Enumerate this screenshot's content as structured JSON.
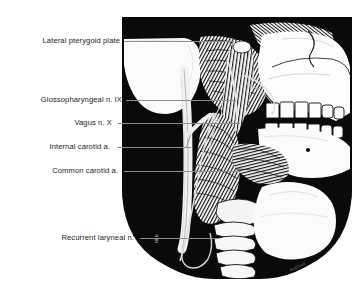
{
  "figure": {
    "type": "anatomical-illustration",
    "style": "pen-and-ink line drawing on black field",
    "background_color": "#ffffff",
    "plate_color": "#0a0a0a",
    "label_color": "#1c1c1c",
    "leader_color": "#9a9a9a"
  },
  "labels": [
    {
      "id": "lateral-pterygoid-plate",
      "text": "Lateral pterygoid plate",
      "leader_from_x": 124,
      "leader_to_x": 232,
      "leader_y": 41
    },
    {
      "id": "glossopharyngeal-nerve",
      "text": "Glossopharyngeal n. IX",
      "leader_from_x": 126,
      "leader_to_x": 235,
      "leader_y": 100
    },
    {
      "id": "vagus-nerve",
      "text": "Vagus n. X",
      "leader_from_x": 118,
      "leader_to_x": 238,
      "leader_y": 123
    },
    {
      "id": "internal-carotid-artery",
      "text": "Internal carotid a.",
      "leader_from_x": 117,
      "leader_to_x": 190,
      "leader_y": 147
    },
    {
      "id": "common-carotid-artery",
      "text": "Common carotid a.",
      "leader_from_x": 124,
      "leader_to_x": 238,
      "leader_y": 171
    },
    {
      "id": "recurrent-laryngeal-nerve",
      "text": "Recurrent laryneal n.",
      "leader_from_x": 140,
      "leader_to_x": 218,
      "leader_y": 238
    }
  ],
  "signature": {
    "text": "Nucleus",
    "x": 289,
    "y": 264
  },
  "inline_marks": {
    "recurrent_tick": "RLN"
  }
}
